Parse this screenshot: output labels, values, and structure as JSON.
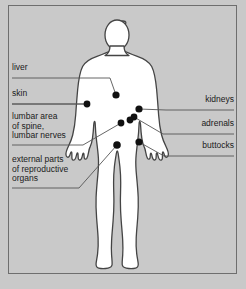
{
  "figure": {
    "background_color": "#c9c9c9",
    "body_fill": "#ffffff",
    "outline_color": "#444444",
    "dot_color": "#111111",
    "text_color": "#1a1a1a",
    "leader_line_color": "#555555",
    "frame_color": "#6e6e6e"
  },
  "labels_left": [
    {
      "id": "liver",
      "text": "liver",
      "x": 12,
      "y": 68,
      "underline_y": 78,
      "underline_x1": 12,
      "underline_x2": 100
    },
    {
      "id": "skin",
      "text": "skin",
      "x": 12,
      "y": 94,
      "underline_y": 104,
      "underline_x1": 12,
      "underline_x2": 86
    },
    {
      "id": "lumbar",
      "text": "lumbar area\nof spine,\nlumbar nerves",
      "x": 12,
      "y": 116,
      "underline_y": 145,
      "underline_x1": 12,
      "underline_x2": 83
    },
    {
      "id": "reproductive",
      "text": "external parts\nof reproductive\norgans",
      "x": 12,
      "y": 159,
      "underline_y": 188,
      "underline_x1": 12,
      "underline_x2": 79
    }
  ],
  "labels_right": [
    {
      "id": "kidneys",
      "text": "kidneys",
      "x": 234,
      "y": 100,
      "underline_y": 110,
      "underline_x1": 166,
      "underline_x2": 234
    },
    {
      "id": "adrenals",
      "text": "adrenals",
      "x": 234,
      "y": 124,
      "underline_y": 134,
      "underline_x1": 163,
      "underline_x2": 234
    },
    {
      "id": "buttocks",
      "text": "buttocks",
      "x": 234,
      "y": 146,
      "underline_y": 156,
      "underline_x1": 164,
      "underline_x2": 234
    }
  ],
  "dots": [
    {
      "id": "liver-dot",
      "cx": 116,
      "cy": 95,
      "r": 3.6
    },
    {
      "id": "skin-dot",
      "cx": 87,
      "cy": 104,
      "r": 3.4
    },
    {
      "id": "kidneys-dot",
      "cx": 139,
      "cy": 109,
      "r": 3.6
    },
    {
      "id": "adrenals-dot",
      "cx": 134,
      "cy": 117,
      "r": 3.4
    },
    {
      "id": "lumbar-dot-a",
      "cx": 130,
      "cy": 120,
      "r": 3.4
    },
    {
      "id": "lumbar-dot-b",
      "cx": 121,
      "cy": 123,
      "r": 3.4
    },
    {
      "id": "buttocks-dot",
      "cx": 139,
      "cy": 142,
      "r": 3.6
    },
    {
      "id": "reproductive-dot",
      "cx": 117,
      "cy": 145,
      "r": 3.8
    }
  ],
  "leader_lines": [
    {
      "id": "liver-leader",
      "points": "100,78 110,78 116,95"
    },
    {
      "id": "skin-leader",
      "points": "12,104 87,104"
    },
    {
      "id": "lumbar-leader",
      "points": "83,145 121,123"
    },
    {
      "id": "reproductive-leader",
      "points": "79,188 117,145"
    },
    {
      "id": "kidneys-leader",
      "points": "166,110 139,109"
    },
    {
      "id": "adrenals-leader",
      "points": "163,134 134,117"
    },
    {
      "id": "buttocks-leader",
      "points": "164,156 139,142"
    }
  ],
  "body_outline_path": "M123.5,23 C117.5,23 112.5,27.5 112,34.5 C111.7,39.5 112.3,43.5 113.5,46.5 C114.2,48.2 113.8,49.5 112.2,50.5 C109,52.5 104,54.2 98,56.2 C91,58.5 86,61.5 83.5,66 C81,70.5 79.5,78 78.5,88 C77.6,97.5 77,106 76.5,113 C76,120 75,127 73.5,133 C72.3,137.8 70.5,141.5 69,144.5 C67.5,147.5 66.5,150.5 66.8,152.5 C67.1,154.5 68.5,155.2 69.5,154.2 C70.3,153.4 70.8,152 71.2,150.5 C71.5,149.3 72.2,149.2 72.3,150.3 C72.5,152.2 72.2,154.5 72.5,156 C72.8,157.5 74,158 75,157 C76,156 76.5,154 77,151.8 C77.4,150 78,150 78.2,151.5 C78.4,153 78.2,155 78.6,156.2 C79,157.4 80.2,157.6 81,156.6 C81.8,155.6 82.3,153.8 82.7,151.8 C83,150.3 83.6,150.3 83.8,151.5 C84,153 83.9,154.5 84.3,155.5 C84.7,156.5 85.8,156.6 86.5,155.6 C87.3,154.5 87.8,152.5 88.2,150.3 C88.6,148 89,146 89.8,144.5 C90.8,142.5 91.5,140 92,136.5 C92.6,132.5 93,128 93.3,123 C93.5,119.5 94.5,119.5 94.6,122.5 C94.8,127.5 95.2,133.5 96,139.5 C96.8,145.5 97.5,151 97.8,156 C98.1,161 97.8,166.5 97.2,172.5 C96.5,179.5 95.8,186.5 95.5,193.5 C95.2,200.5 95.5,207 96,213.5 C96.5,220 97.2,226.5 97.5,233 C97.8,239 97.5,244 97,248 C96.5,252 95.8,255 95.5,257.5 C95.2,260 96,261.5 98,262 C100.5,262.6 104,262.6 107,262 C109.5,261.5 110.8,260.5 111,258.5 C111.2,256.5 110.8,253.5 110.5,249.5 C110.2,245.5 110.2,241 110.5,235.5 C110.8,229.5 111.5,223 112,216.5 C112.5,210 112.8,204 112.8,198 C112.8,192 112.5,186 112.5,180 C112.5,174 112.8,169 113.3,164.5 C113.8,160 114.5,156 115.2,152 C115.8,148.5 116.5,148.5 117,152 C117.6,156 118.2,160 118.7,164.5 C119.2,169 119.5,174 119.5,180 C119.5,186 119.2,192 119.2,198 C119.2,204 119.5,210 120,216.5 C120.5,223 121.2,229.5 121.5,235.5 C121.8,241 121.8,245.5 121.5,249.5 C121.2,253.5 120.8,256.5 121,258.5 C121.2,260.5 122.5,261.5 125,262 C128,262.6 131.5,262.6 134,262 C136,261.5 136.8,260 136.5,257.5 C136.2,255 135.5,252 135,248 C134.5,244 134.2,239 134.5,233 C134.8,226.5 135.5,220 136,213.5 C136.5,207 136.8,200.5 136.5,193.5 C136.2,186.5 135.5,179.5 134.8,172.5 C134.2,166.5 133.9,161 134.2,156 C134.5,151 135.2,145.5 136,139.5 C136.8,133.5 137.2,127.5 137.4,122.5 C137.5,119.5 138.5,119.5 138.7,123 C139,128 139.4,132.5 140,136.5 C140.5,140 141.2,142.5 142.2,144.5 C143,146 143.4,148 143.8,150.3 C144.2,152.5 144.7,154.5 145.5,155.6 C146.2,156.6 147.3,156.5 147.7,155.5 C148.1,154.5 148,153 148.2,151.5 C148.4,150.3 149,150.3 149.3,151.8 C149.7,153.8 150.2,155.6 151,156.6 C151.8,157.6 153,157.4 153.4,156.2 C153.8,155 153.6,153 153.8,151.5 C154,150 154.6,150 155,151.8 C155.5,154 156,156 157,157 C158,158 159.2,157.5 159.5,156 C159.8,154.5 159.5,152.2 159.7,150.3 C159.8,149.2 160.5,149.3 160.8,150.5 C161.2,152 161.7,153.4 162.5,154.2 C163.5,155.2 164.9,154.5 165.2,152.5 C165.5,150.5 164.5,147.5 163,144.5 C161.5,141.5 159.7,137.8 158.5,133 C157,127 156,120 155.5,113 C155,106 154.4,97.5 153.5,88 C152.5,78 151,70.5 148.5,66 C146,61.5 141,58.5 134,56.2 C128,54.2 123,52.5 119.8,50.5 C118.2,49.5 117.8,48.2 118.5,46.5 C119.7,43.5 120.3,39.5 120,34.5 C119.5,27.5 129.5,23 123.5,23 Z"
}
